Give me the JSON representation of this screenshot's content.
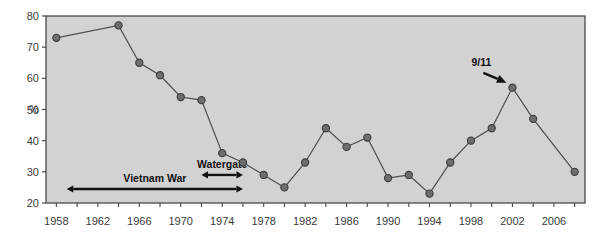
{
  "chart_data": {
    "type": "line",
    "title": "",
    "subtitle": "",
    "xlabel": "",
    "ylabel": "%",
    "xlim": [
      1957,
      2009
    ],
    "ylim": [
      20,
      80
    ],
    "grid": false,
    "legend": "none",
    "x_tick_labels": [
      "1958",
      "1962",
      "1966",
      "1970",
      "1974",
      "1978",
      "1982",
      "1986",
      "1990",
      "1994",
      "1998",
      "2002",
      "2006"
    ],
    "x_tick_values": [
      1958,
      1962,
      1966,
      1970,
      1974,
      1978,
      1982,
      1986,
      1990,
      1994,
      1998,
      2002,
      2006
    ],
    "x_minor_tick_values": [
      1958,
      1960,
      1962,
      1964,
      1966,
      1968,
      1970,
      1972,
      1974,
      1976,
      1978,
      1980,
      1982,
      1984,
      1986,
      1988,
      1990,
      1992,
      1994,
      1996,
      1998,
      2000,
      2002,
      2004,
      2006,
      2008
    ],
    "y_tick_labels": [
      "20",
      "30",
      "40",
      "50",
      "60",
      "70",
      "80"
    ],
    "y_tick_values": [
      20,
      30,
      40,
      50,
      60,
      70,
      80
    ],
    "x": [
      1958,
      1964,
      1966,
      1968,
      1970,
      1972,
      1974,
      1976,
      1978,
      1980,
      1982,
      1984,
      1986,
      1988,
      1990,
      1992,
      1994,
      1996,
      1998,
      2000,
      2002,
      2004,
      2008
    ],
    "values": [
      73,
      77,
      65,
      61,
      54,
      53,
      36,
      33,
      29,
      25,
      33,
      44,
      38,
      41,
      28,
      29,
      23,
      33,
      40,
      44,
      57,
      47,
      30
    ],
    "series": [
      {
        "name": "Trust in government",
        "values": [
          73,
          77,
          65,
          61,
          54,
          53,
          36,
          33,
          29,
          25,
          33,
          44,
          38,
          41,
          28,
          29,
          23,
          33,
          40,
          44,
          57,
          47,
          30
        ]
      }
    ],
    "annotations": [
      {
        "label": "Vietnam War",
        "type": "double-arrow-span",
        "x_start": 1959,
        "x_end": 1976,
        "y": 24.5
      },
      {
        "label": "Watergate",
        "type": "double-arrow-span",
        "x_start": 1972,
        "x_end": 1976,
        "y": 29.0
      },
      {
        "label": "9/11",
        "type": "pointer-arrow",
        "x_target": 2002,
        "y_target": 57,
        "x_label": 1999,
        "y_label": 64
      }
    ],
    "colors": {
      "plot_background": "#d2d2d2",
      "plot_border": "#4a4a4a",
      "line": "#4d4d4d",
      "marker_fill": "#6e6e6e",
      "marker_stroke": "#3c3c3c",
      "text": "#3a3a3a",
      "annotation": "#111111",
      "page_background": "#ffffff"
    }
  }
}
